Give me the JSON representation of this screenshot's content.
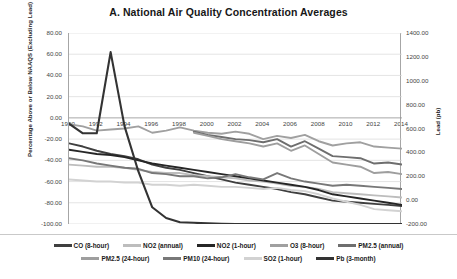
{
  "chart_data": {
    "type": "line",
    "title": "A. National Air Quality Concentration Averages",
    "xlabel": "",
    "ylabel": "Percentage Above or Below NAAQS (Excluding Lead)",
    "y2label": "Lead (pb)",
    "grid": true,
    "legend_position": "bottom",
    "ylim": [
      -100,
      80
    ],
    "y2lim": [
      -200,
      1400
    ],
    "yticks": [
      "80.00",
      "60.00",
      "40.00",
      "20.00",
      "0.00",
      "-20.00",
      "-40.00",
      "-60.00",
      "-80.00",
      "-100.00"
    ],
    "y2ticks": [
      "1400.00",
      "1200.00",
      "1000.00",
      "800.00",
      "600.00",
      "400.00",
      "200.00",
      "0.00",
      "-200.00"
    ],
    "x": [
      1990,
      1991,
      1992,
      1993,
      1994,
      1995,
      1996,
      1997,
      1998,
      1999,
      2000,
      2001,
      2002,
      2003,
      2004,
      2005,
      2006,
      2007,
      2008,
      2009,
      2010,
      2011,
      2012,
      2013,
      2014
    ],
    "xticks": [
      "1990",
      "1992",
      "1994",
      "1996",
      "1998",
      "2000",
      "2002",
      "2004",
      "2006",
      "2008",
      "2010",
      "2012",
      "2014"
    ],
    "series": [
      {
        "name": "CO (8-hour)",
        "axis": "left",
        "color": "#3f3f3f",
        "width": 1.9,
        "values": [
          -24,
          -27,
          -31,
          -34,
          -36,
          -39,
          -44,
          -47,
          -49,
          -52,
          -55,
          -58,
          -61,
          -63,
          -65,
          -67,
          -70,
          -72,
          -75,
          -78,
          -79,
          -80,
          -81,
          -82,
          -83
        ]
      },
      {
        "name": "NO2 (annual)",
        "axis": "left",
        "color": "#bdbdbd",
        "width": 1.9,
        "values": [
          -44,
          -45,
          -46,
          -46,
          -47,
          -49,
          -51,
          -52,
          -52,
          -54,
          -55,
          -56,
          -57,
          -59,
          -60,
          -62,
          -64,
          -65,
          -67,
          -70,
          -71,
          -72,
          -73,
          -74,
          -75
        ]
      },
      {
        "name": "NO2 (1-hour)",
        "axis": "left",
        "color": "#262626",
        "width": 1.9,
        "values": [
          -30,
          -32,
          -34,
          -35,
          -37,
          -40,
          -43,
          -45,
          -47,
          -49,
          -51,
          -53,
          -55,
          -57,
          -59,
          -61,
          -63,
          -65,
          -68,
          -72,
          -74,
          -76,
          -78,
          -80,
          -82
        ]
      },
      {
        "name": "O3 (8-hour)",
        "axis": "left",
        "color": "#a0a0a0",
        "width": 1.9,
        "values": [
          -6,
          -8,
          -12,
          -11,
          -10,
          -8,
          -14,
          -12,
          -9,
          -12,
          -14,
          -15,
          -13,
          -15,
          -20,
          -17,
          -19,
          -16,
          -22,
          -26,
          -24,
          -23,
          -27,
          -28,
          -29
        ]
      },
      {
        "name": "PM2.5 (annual)",
        "axis": "left",
        "color": "#6e6e6e",
        "width": 1.9,
        "values": [
          null,
          null,
          null,
          null,
          null,
          null,
          null,
          null,
          null,
          -13,
          -16,
          -18,
          -20,
          -21,
          -23,
          -20,
          -27,
          -22,
          -29,
          -36,
          -37,
          -38,
          -43,
          -42,
          -44
        ]
      },
      {
        "name": "PM2.5 (24-hour)",
        "axis": "left",
        "color": "#9e9e9e",
        "width": 1.9,
        "values": [
          null,
          null,
          null,
          null,
          null,
          null,
          null,
          null,
          null,
          -14,
          -17,
          -20,
          -22,
          -24,
          -27,
          -24,
          -31,
          -26,
          -34,
          -42,
          -44,
          -46,
          -52,
          -51,
          -53
        ]
      },
      {
        "name": "PM10 (24-hour)",
        "axis": "left",
        "color": "#787878",
        "width": 1.9,
        "values": [
          -38,
          -40,
          -43,
          -45,
          -47,
          -48,
          -52,
          -53,
          -55,
          -55,
          -57,
          -56,
          -53,
          -56,
          -58,
          -52,
          -57,
          -60,
          -62,
          -64,
          -63,
          -64,
          -65,
          -66,
          -67
        ]
      },
      {
        "name": "SO2 (1-hour)",
        "axis": "left",
        "color": "#d2d2d2",
        "width": 1.9,
        "values": [
          -58,
          -59,
          -60,
          -60,
          -61,
          -61,
          -63,
          -63,
          -64,
          -63,
          -64,
          -65,
          -65,
          -66,
          -67,
          -66,
          -68,
          -69,
          -72,
          -76,
          -79,
          -82,
          -86,
          -87,
          -88
        ]
      },
      {
        "name": "Pb (3-month)",
        "axis": "right",
        "color": "#333333",
        "width": 2.1,
        "values": [
          640,
          560,
          560,
          1240,
          620,
          240,
          -60,
          -150,
          -185,
          -190,
          -195,
          -198,
          -200,
          -200,
          -200,
          -200,
          -200,
          -200,
          -200,
          -200,
          -200,
          -200,
          -200,
          -200,
          -200
        ]
      }
    ]
  },
  "legend": {
    "row1": [
      {
        "label": "CO (8-hour)",
        "color": "#3f3f3f"
      },
      {
        "label": "NO2 (annual)",
        "color": "#bdbdbd"
      },
      {
        "label": "NO2 (1-hour)",
        "color": "#262626"
      },
      {
        "label": "O3 (8-hour)",
        "color": "#a0a0a0"
      },
      {
        "label": "PM2.5 (annual)",
        "color": "#6e6e6e"
      }
    ],
    "row2": [
      {
        "label": "PM2.5 (24-hour)",
        "color": "#9e9e9e"
      },
      {
        "label": "PM10 (24-hour)",
        "color": "#787878"
      },
      {
        "label": "SO2 (1-hour)",
        "color": "#d2d2d2"
      },
      {
        "label": "Pb (3-month)",
        "color": "#333333"
      }
    ]
  }
}
